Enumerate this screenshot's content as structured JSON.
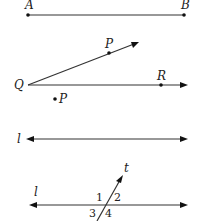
{
  "figures": {
    "segment": {
      "start_label": "A",
      "end_label": "B"
    },
    "angle": {
      "vertex_label": "Q",
      "upper_point_label": "P",
      "lower_point_label": "R",
      "outside_point_label": "P"
    },
    "line": {
      "label": "l"
    },
    "transversal": {
      "line_label": "l",
      "transversal_label": "t",
      "angle_labels": [
        "1",
        "2",
        "3",
        "4"
      ]
    }
  }
}
